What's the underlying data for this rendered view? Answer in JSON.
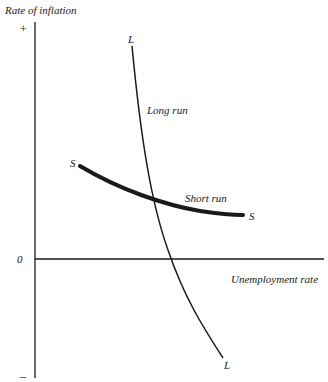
{
  "diagram": {
    "type": "phillips-curve",
    "y_axis_label": "Rate of inflation",
    "y_axis_plus": "+",
    "y_axis_minus": "–",
    "origin_label": "0",
    "x_axis_label": "Unemployment rate",
    "long_run": {
      "label": "Long run",
      "start_label": "L",
      "end_label": "L"
    },
    "short_run": {
      "label": "Short run",
      "start_label": "S",
      "end_label": "S"
    }
  }
}
